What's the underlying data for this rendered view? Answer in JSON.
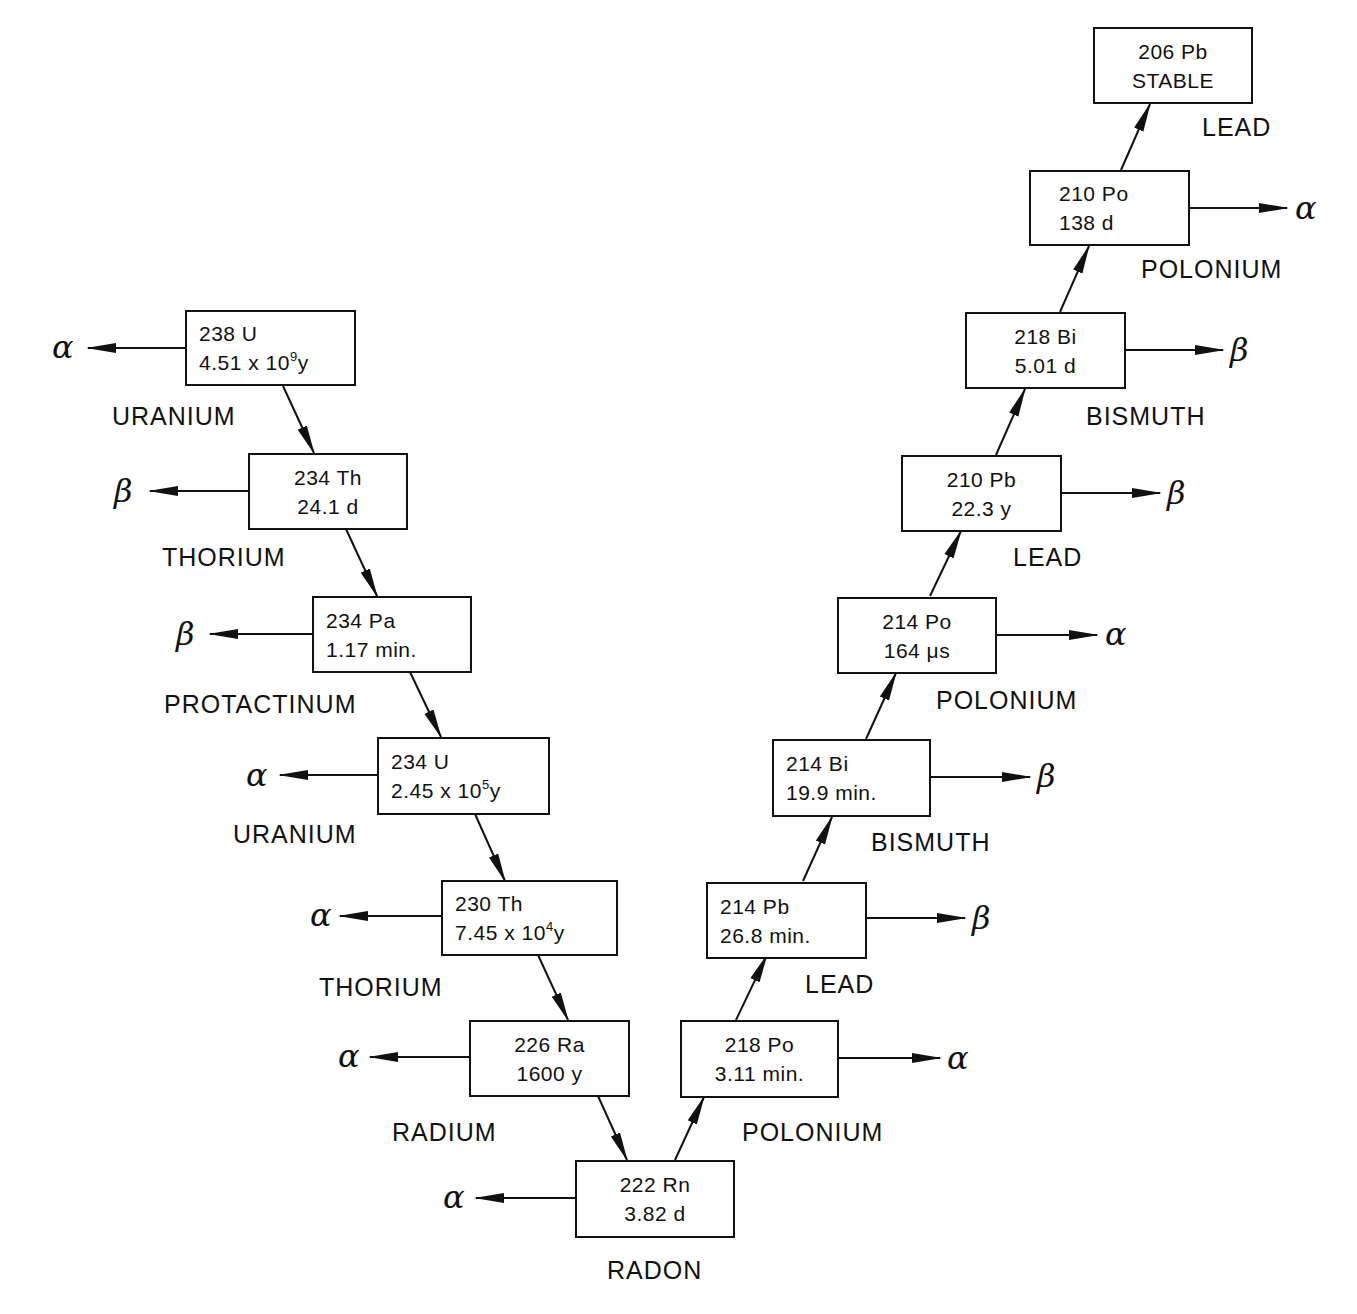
{
  "diagram": {
    "nuclides": [
      {
        "id": "u238",
        "mass": "238",
        "symbol": "U",
        "line1": "238  U",
        "halflife_base": "4.51  x  10",
        "halflife_exp": "9",
        "halflife_unit": "y",
        "element": "URANIUM",
        "emission": "α",
        "emission_side": "left"
      },
      {
        "id": "th234",
        "line1": "234  Th",
        "line2": "24.1  d",
        "element": "THORIUM",
        "emission": "β",
        "emission_side": "left"
      },
      {
        "id": "pa234",
        "line1": "234  Pa",
        "line2": "1.17  min.",
        "element": "PROTACTINUM",
        "emission": "β",
        "emission_side": "left"
      },
      {
        "id": "u234",
        "line1": "234  U",
        "halflife_base": "2.45  x  10",
        "halflife_exp": "5",
        "halflife_unit": "y",
        "element": "URANIUM",
        "emission": "α",
        "emission_side": "left"
      },
      {
        "id": "th230",
        "line1": "230  Th",
        "halflife_base": "7.45  x  10",
        "halflife_exp": "4",
        "halflife_unit": "y",
        "element": "THORIUM",
        "emission": "α",
        "emission_side": "left"
      },
      {
        "id": "ra226",
        "line1": "226  Ra",
        "line2": "1600  y",
        "element": "RADIUM",
        "emission": "α",
        "emission_side": "left"
      },
      {
        "id": "rn222",
        "line1": "222  Rn",
        "line2": "3.82  d",
        "element": "RADON",
        "emission": "α",
        "emission_side": "left"
      },
      {
        "id": "po218",
        "line1": "218  Po",
        "line2": "3.11  min.",
        "element": "POLONIUM",
        "emission": "α",
        "emission_side": "right"
      },
      {
        "id": "pb214",
        "line1": "214  Pb",
        "line2": "26.8  min.",
        "element": "LEAD",
        "emission": "β",
        "emission_side": "right"
      },
      {
        "id": "bi214",
        "line1": "214  Bi",
        "line2": "19.9  min.",
        "element": "BISMUTH",
        "emission": "β",
        "emission_side": "right"
      },
      {
        "id": "po214",
        "line1": "214  Po",
        "line2": "164 μs",
        "element": "POLONIUM",
        "emission": "α",
        "emission_side": "right"
      },
      {
        "id": "pb210",
        "line1": "210  Pb",
        "line2": "22.3  y",
        "element": "LEAD",
        "emission": "β",
        "emission_side": "right"
      },
      {
        "id": "bi210",
        "line1": "218  Bi",
        "line2": "5.01  d",
        "element": "BISMUTH",
        "emission": "β",
        "emission_side": "right"
      },
      {
        "id": "po210",
        "line1": "210  Po",
        "line2": "138  d",
        "element": "POLONIUM",
        "emission": "α",
        "emission_side": "right"
      },
      {
        "id": "pb206",
        "line1": "206  Pb",
        "line2": "STABLE",
        "element": "LEAD",
        "emission": null
      }
    ]
  }
}
